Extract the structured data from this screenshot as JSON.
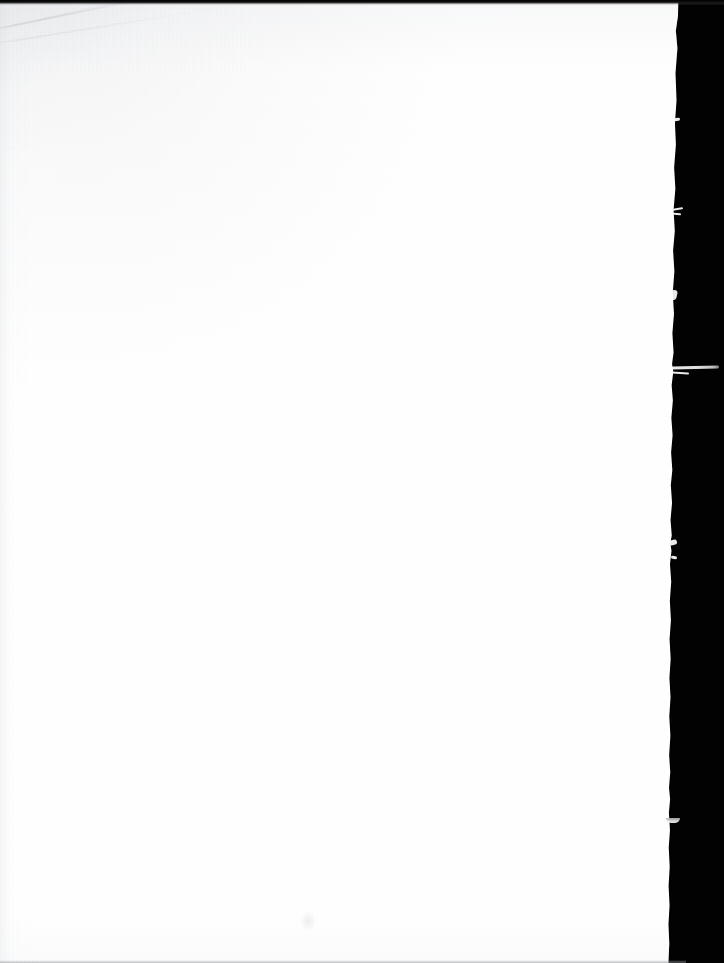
{
  "document": {
    "kind": "scanned-page-image",
    "page_content_text": "",
    "page_state_label": "Blank page — no printed text, figures, or page number",
    "dimensions": {
      "width_px": 724,
      "height_px": 963
    }
  },
  "page": {
    "name": "scanned-sheet",
    "background_color": "#ffffff",
    "width_px": 690,
    "height_px": 963,
    "paper_tone_hex": "#fdfdfd",
    "shadow_tone_hex": "#eceef1"
  },
  "scanner_background": {
    "name": "platen",
    "color_hex": "#020202",
    "side": "right",
    "strip_start_x_px": 678,
    "strip_width_px": 46
  },
  "artifacts": {
    "top_band": {
      "label": "dark scan band along top edge",
      "color_hex": "#000000",
      "height_px": 5
    },
    "bottom_line": {
      "label": "faint grey line along bottom edge",
      "color_hex": "#a8aaae",
      "height_px": 3
    },
    "crease": {
      "label": "diagonal fold crease in upper-left corner",
      "color_hex": "#c4c7cc",
      "angle_deg": -11.5
    },
    "torn_edge": {
      "label": "ragged torn right-hand edge of the sheet",
      "fiber_count": 9
    },
    "smudge": {
      "label": "faint smudge near lower centre",
      "color_hex": "#c4c6cb"
    },
    "grain": {
      "label": "paper grain and scanner noise"
    }
  }
}
